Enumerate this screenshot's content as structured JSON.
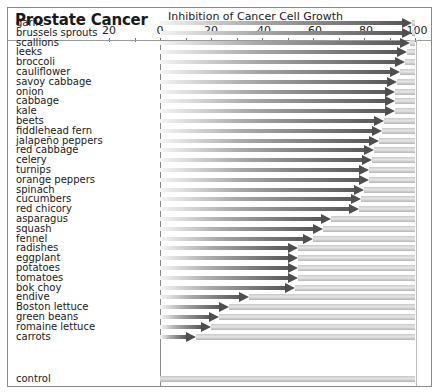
{
  "chart_data": {
    "type": "bar",
    "title": "Prostate Cancer",
    "xlabel": "Inhibition of Cancer Cell Growth",
    "ylabel": "",
    "x_tick_labels": [
      "20",
      "0",
      "20",
      "-40",
      "-60",
      "-80",
      "-100"
    ],
    "x_tick_values": [
      20,
      0,
      -20,
      -40,
      -60,
      -80,
      -100
    ],
    "xlim": [
      20,
      -100
    ],
    "grid": false,
    "legend": null,
    "orientation": "horizontal",
    "categories": [
      "garlic",
      "brussels sprouts",
      "scallions",
      "leeks",
      "broccoli",
      "cauliflower",
      "savoy cabbage",
      "onion",
      "cabbage",
      "kale",
      "beets",
      "fiddlehead fern",
      "jalapeño peppers",
      "red cabbage",
      "celery",
      "turnips",
      "orange peppers",
      "spinach",
      "cucumbers",
      "red chicory",
      "asparagus",
      "squash",
      "fennel",
      "radishes",
      "eggplant",
      "potatoes",
      "tomatoes",
      "bok choy",
      "endive",
      "Boston lettuce",
      "green beans",
      "romaine lettuce",
      "carrots",
      "control"
    ],
    "values": [
      -99,
      -99,
      -98,
      -97,
      -96,
      -94,
      -93,
      -92,
      -92,
      -92,
      -88,
      -87,
      -86,
      -84,
      -83,
      -82,
      -82,
      -80,
      -79,
      -78,
      -67,
      -64,
      -60,
      -54,
      -54,
      -54,
      -54,
      -53,
      -35,
      -27,
      -23,
      -20,
      -14,
      0
    ]
  },
  "title": "Prostate Cancer",
  "axis_title": "Inhibition of Cancer Cell Growth",
  "ticks": [
    {
      "label": "20",
      "value": 20
    },
    {
      "label": "0",
      "value": 0
    },
    {
      "label": "20",
      "value": -20
    },
    {
      "label": "-40",
      "value": -40
    },
    {
      "label": "-60",
      "value": -60
    },
    {
      "label": "-80",
      "value": -80
    },
    {
      "label": "-100",
      "value": -100
    }
  ]
}
